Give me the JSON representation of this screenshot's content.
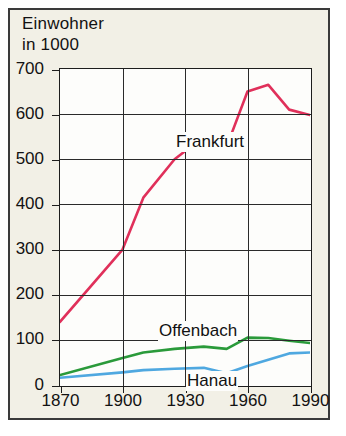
{
  "figure": {
    "header_line1": "Einwohner",
    "header_line2": "in 1000",
    "background_color": "#f2f0e6",
    "border_color": "#3a3a3a"
  },
  "chart_data": {
    "type": "line",
    "title": "Einwohner in 1000",
    "xlabel": "",
    "ylabel": "Einwohner in 1000",
    "xlim": [
      1870,
      1990
    ],
    "ylim": [
      0,
      700
    ],
    "grid": true,
    "legend": "inline-annotations",
    "x_ticks": [
      1870,
      1900,
      1930,
      1960,
      1990
    ],
    "y_ticks": [
      0,
      100,
      200,
      300,
      400,
      500,
      600,
      700
    ],
    "series": [
      {
        "name": "Frankfurt",
        "color": "#e0305a",
        "x": [
          1870,
          1900,
          1910,
          1925,
          1939,
          1950,
          1960,
          1970,
          1980,
          1990
        ],
        "values": [
          140,
          300,
          415,
          500,
          550,
          528,
          650,
          665,
          610,
          598
        ]
      },
      {
        "name": "Offenbach",
        "color": "#2a9a3a",
        "x": [
          1870,
          1900,
          1910,
          1925,
          1939,
          1950,
          1960,
          1970,
          1980,
          1990
        ],
        "values": [
          22,
          60,
          72,
          80,
          85,
          80,
          105,
          104,
          98,
          93
        ]
      },
      {
        "name": "Hanau",
        "color": "#4fa8e0",
        "x": [
          1870,
          1900,
          1910,
          1925,
          1939,
          1950,
          1960,
          1970,
          1980,
          1990
        ],
        "values": [
          16,
          28,
          33,
          36,
          38,
          26,
          42,
          56,
          70,
          72
        ]
      }
    ]
  }
}
